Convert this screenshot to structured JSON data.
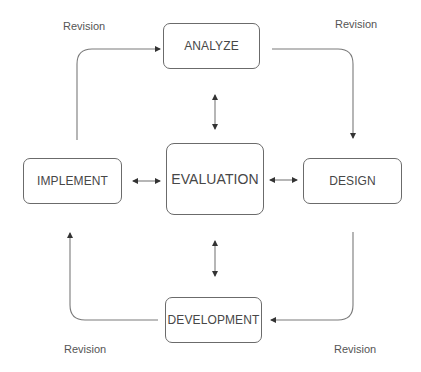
{
  "diagram": {
    "type": "cycle",
    "nodes": [
      {
        "id": "analyze",
        "label": "ANALYZE"
      },
      {
        "id": "design",
        "label": "DESIGN"
      },
      {
        "id": "development",
        "label": "DEVELOPMENT"
      },
      {
        "id": "implement",
        "label": "IMPLEMENT"
      },
      {
        "id": "evaluation",
        "label": "EVALUATION"
      }
    ],
    "edges": [
      {
        "from": "implement",
        "to": "analyze",
        "label": "Revision"
      },
      {
        "from": "analyze",
        "to": "design",
        "label": "Revision"
      },
      {
        "from": "design",
        "to": "development",
        "label": "Revision"
      },
      {
        "from": "development",
        "to": "implement",
        "label": "Revision"
      },
      {
        "from": "evaluation",
        "to": "analyze",
        "bidirectional": true
      },
      {
        "from": "evaluation",
        "to": "design",
        "bidirectional": true
      },
      {
        "from": "evaluation",
        "to": "development",
        "bidirectional": true
      },
      {
        "from": "evaluation",
        "to": "implement",
        "bidirectional": true
      }
    ],
    "edge_labels": {
      "top_left": "Revision",
      "top_right": "Revision",
      "bottom_left": "Revision",
      "bottom_right": "Revision"
    }
  },
  "colors": {
    "stroke": "#6b6b6b",
    "text": "#474747",
    "background": "#ffffff"
  }
}
